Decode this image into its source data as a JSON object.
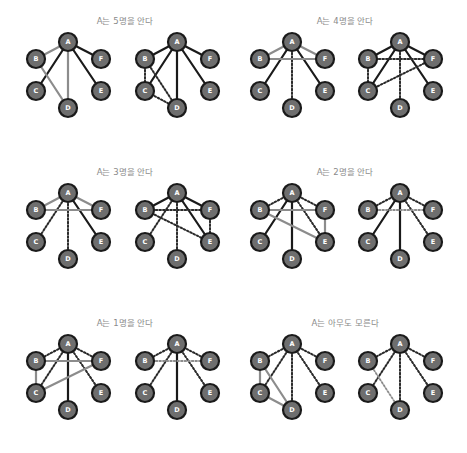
{
  "figure": {
    "width": 467,
    "height": 453,
    "colors": {
      "background": "#ffffff",
      "node_fill": "#6e6e6e",
      "node_stroke": "#1a1a1a",
      "node_label": "#ffffff",
      "edge_known": "#1a1a1a",
      "edge_third_party": "#8c8c8c",
      "edge_unknown": "#2a2a2a",
      "edge_unknown_light": "#8c8c8c",
      "title": "#8a8a8a"
    },
    "node_radius": 9,
    "node_offsets": {
      "A": [
        0,
        0
      ],
      "B": [
        -32,
        17
      ],
      "F": [
        33,
        17
      ],
      "C": [
        -32,
        49
      ],
      "E": [
        33,
        49
      ],
      "D": [
        0,
        66
      ]
    },
    "panels": [
      {
        "title": "A는 5명을 안다",
        "title_pos": [
          125,
          24
        ],
        "graphs": [
          {
            "origin": [
              68,
              42
            ],
            "edges": [
              [
                "A",
                "B",
                "gray"
              ],
              [
                "A",
                "C",
                "solid"
              ],
              [
                "A",
                "D",
                "gray"
              ],
              [
                "A",
                "E",
                "solid"
              ],
              [
                "A",
                "F",
                "solid"
              ],
              [
                "B",
                "D",
                "gray"
              ]
            ]
          },
          {
            "origin": [
              177,
              42
            ],
            "edges": [
              [
                "A",
                "B",
                "solid"
              ],
              [
                "A",
                "C",
                "solid"
              ],
              [
                "A",
                "D",
                "solid"
              ],
              [
                "A",
                "E",
                "solid"
              ],
              [
                "A",
                "F",
                "solid"
              ],
              [
                "B",
                "C",
                "dotted"
              ],
              [
                "B",
                "D",
                "dotted"
              ],
              [
                "C",
                "D",
                "dotted"
              ]
            ]
          }
        ]
      },
      {
        "title": "A는 4명을 안다",
        "title_pos": [
          345,
          24
        ],
        "graphs": [
          {
            "origin": [
              292,
              42
            ],
            "edges": [
              [
                "A",
                "B",
                "gray"
              ],
              [
                "A",
                "C",
                "solid"
              ],
              [
                "A",
                "D",
                "dotted"
              ],
              [
                "A",
                "E",
                "solid"
              ],
              [
                "A",
                "F",
                "gray"
              ],
              [
                "B",
                "F",
                "gray"
              ]
            ]
          },
          {
            "origin": [
              400,
              42
            ],
            "edges": [
              [
                "A",
                "B",
                "solid"
              ],
              [
                "A",
                "C",
                "solid"
              ],
              [
                "A",
                "D",
                "dotted"
              ],
              [
                "A",
                "E",
                "solid"
              ],
              [
                "A",
                "F",
                "solid"
              ],
              [
                "B",
                "F",
                "dotted"
              ],
              [
                "B",
                "C",
                "dotted"
              ],
              [
                "C",
                "F",
                "dotted"
              ]
            ]
          }
        ]
      },
      {
        "title": "A는 3명을 안다",
        "title_pos": [
          125,
          175
        ],
        "graphs": [
          {
            "origin": [
              68,
              193
            ],
            "edges": [
              [
                "A",
                "B",
                "gray"
              ],
              [
                "A",
                "C",
                "dotted"
              ],
              [
                "A",
                "D",
                "dotted"
              ],
              [
                "A",
                "E",
                "solid"
              ],
              [
                "A",
                "F",
                "gray"
              ],
              [
                "B",
                "F",
                "gray"
              ]
            ]
          },
          {
            "origin": [
              177,
              193
            ],
            "edges": [
              [
                "A",
                "B",
                "solid"
              ],
              [
                "A",
                "C",
                "dotted"
              ],
              [
                "A",
                "D",
                "dotted"
              ],
              [
                "A",
                "E",
                "solid"
              ],
              [
                "A",
                "F",
                "solid"
              ],
              [
                "B",
                "F",
                "dotted"
              ],
              [
                "B",
                "E",
                "dotted"
              ],
              [
                "F",
                "E",
                "dotted"
              ]
            ]
          }
        ]
      },
      {
        "title": "A는 2명을 안다",
        "title_pos": [
          345,
          175
        ],
        "graphs": [
          {
            "origin": [
              292,
              193
            ],
            "edges": [
              [
                "A",
                "B",
                "dotted"
              ],
              [
                "A",
                "C",
                "solid"
              ],
              [
                "A",
                "D",
                "solid"
              ],
              [
                "A",
                "E",
                "dotted"
              ],
              [
                "A",
                "F",
                "dotted"
              ],
              [
                "B",
                "F",
                "gray"
              ],
              [
                "B",
                "E",
                "gray"
              ],
              [
                "F",
                "E",
                "gray"
              ]
            ]
          },
          {
            "origin": [
              400,
              193
            ],
            "edges": [
              [
                "A",
                "B",
                "dotted"
              ],
              [
                "A",
                "C",
                "solid"
              ],
              [
                "A",
                "D",
                "solid"
              ],
              [
                "A",
                "E",
                "dotted"
              ],
              [
                "A",
                "F",
                "dotted"
              ],
              [
                "B",
                "F",
                "dotted-light"
              ]
            ]
          }
        ]
      },
      {
        "title": "A는 1명을 안다",
        "title_pos": [
          125,
          326
        ],
        "graphs": [
          {
            "origin": [
              68,
              344
            ],
            "edges": [
              [
                "A",
                "B",
                "dotted"
              ],
              [
                "A",
                "C",
                "dotted"
              ],
              [
                "A",
                "D",
                "solid"
              ],
              [
                "A",
                "E",
                "dotted"
              ],
              [
                "A",
                "F",
                "dotted"
              ],
              [
                "B",
                "F",
                "gray"
              ],
              [
                "B",
                "C",
                "gray"
              ],
              [
                "C",
                "F",
                "gray"
              ]
            ]
          },
          {
            "origin": [
              177,
              344
            ],
            "edges": [
              [
                "A",
                "B",
                "dotted"
              ],
              [
                "A",
                "C",
                "dotted"
              ],
              [
                "A",
                "D",
                "solid"
              ],
              [
                "A",
                "E",
                "dotted"
              ],
              [
                "A",
                "F",
                "dotted"
              ],
              [
                "B",
                "F",
                "dotted-light"
              ]
            ]
          }
        ]
      },
      {
        "title": "A는 아무도 모른다",
        "title_pos": [
          345,
          326
        ],
        "graphs": [
          {
            "origin": [
              292,
              344
            ],
            "edges": [
              [
                "A",
                "B",
                "dotted"
              ],
              [
                "A",
                "C",
                "dotted"
              ],
              [
                "A",
                "D",
                "dotted"
              ],
              [
                "A",
                "E",
                "dotted"
              ],
              [
                "A",
                "F",
                "dotted"
              ],
              [
                "B",
                "C",
                "gray"
              ],
              [
                "B",
                "D",
                "gray"
              ],
              [
                "C",
                "D",
                "gray"
              ]
            ]
          },
          {
            "origin": [
              400,
              344
            ],
            "edges": [
              [
                "A",
                "B",
                "dotted"
              ],
              [
                "A",
                "C",
                "dotted"
              ],
              [
                "A",
                "D",
                "dotted"
              ],
              [
                "A",
                "E",
                "dotted"
              ],
              [
                "A",
                "F",
                "dotted"
              ],
              [
                "B",
                "D",
                "dotted-light"
              ]
            ]
          }
        ]
      }
    ]
  }
}
